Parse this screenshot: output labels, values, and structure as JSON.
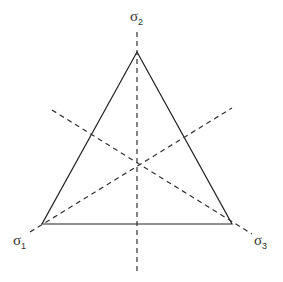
{
  "diagram": {
    "labels": {
      "top": {
        "symbol": "σ",
        "sub": "2"
      },
      "left": {
        "symbol": "σ",
        "sub": "1"
      },
      "right": {
        "symbol": "σ",
        "sub": "3"
      }
    },
    "colors": {
      "line": "#222222",
      "dash": "#333333"
    }
  }
}
